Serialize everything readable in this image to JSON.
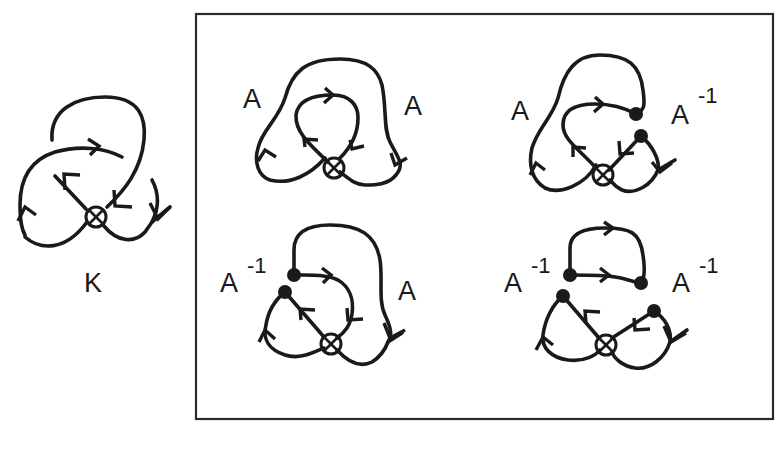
{
  "figure": {
    "knot": {
      "label": "K",
      "virtual_crossing_icon": "otimes-virtual-crossing"
    },
    "states_box": {
      "states": [
        {
          "position": "top-left",
          "left_label": "A",
          "left_sup": "",
          "right_label": "A",
          "right_sup": "",
          "smoothing_dots": 0
        },
        {
          "position": "top-right",
          "left_label": "A",
          "left_sup": "",
          "right_label": "A",
          "right_sup": "-1",
          "smoothing_dots": 2
        },
        {
          "position": "bottom-left",
          "left_label": "A",
          "left_sup": "-1",
          "right_label": "A",
          "right_sup": "",
          "smoothing_dots": 2
        },
        {
          "position": "bottom-right",
          "left_label": "A",
          "left_sup": "-1",
          "right_label": "A",
          "right_sup": "-1",
          "smoothing_dots": 4
        }
      ]
    },
    "colors": {
      "ink": "#1a1a1a",
      "frame": "#2a2a2a",
      "background": "#ffffff"
    }
  }
}
